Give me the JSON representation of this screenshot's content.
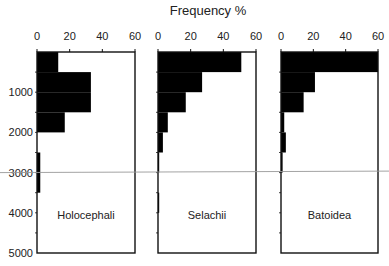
{
  "chart_data": {
    "type": "bar",
    "orientation": "horizontal",
    "title": "Frequency %",
    "xlabel": "Frequency %",
    "ylabel": "Depth (m)",
    "xlim": [
      0,
      60
    ],
    "ylim": [
      0,
      5000
    ],
    "x_ticks": [
      0,
      20,
      40,
      60
    ],
    "y_ticks": [
      1000,
      2000,
      3000,
      4000,
      5000
    ],
    "bin_size": 500,
    "reference_line": {
      "depth": 3000,
      "color": "#999999"
    },
    "bar_color": "#000000",
    "panels": [
      {
        "name": "Holocephali",
        "bins": [
          {
            "from": 0,
            "to": 500,
            "value": 13
          },
          {
            "from": 500,
            "to": 1000,
            "value": 33
          },
          {
            "from": 1000,
            "to": 1500,
            "value": 33
          },
          {
            "from": 1500,
            "to": 2000,
            "value": 17
          },
          {
            "from": 2500,
            "to": 3000,
            "value": 2
          },
          {
            "from": 3000,
            "to": 3500,
            "value": 2
          }
        ]
      },
      {
        "name": "Selachii",
        "bins": [
          {
            "from": 0,
            "to": 500,
            "value": 51
          },
          {
            "from": 500,
            "to": 1000,
            "value": 27
          },
          {
            "from": 1000,
            "to": 1500,
            "value": 17
          },
          {
            "from": 1500,
            "to": 2000,
            "value": 6
          },
          {
            "from": 2000,
            "to": 2500,
            "value": 3
          },
          {
            "from": 2500,
            "to": 3000,
            "value": 0.5
          },
          {
            "from": 3500,
            "to": 4000,
            "value": 0.5
          }
        ]
      },
      {
        "name": "Batoidea",
        "bins": [
          {
            "from": 0,
            "to": 500,
            "value": 60
          },
          {
            "from": 500,
            "to": 1000,
            "value": 21
          },
          {
            "from": 1000,
            "to": 1500,
            "value": 14
          },
          {
            "from": 1500,
            "to": 2000,
            "value": 2
          },
          {
            "from": 2000,
            "to": 2500,
            "value": 3
          },
          {
            "from": 2500,
            "to": 3000,
            "value": 1
          }
        ]
      }
    ]
  }
}
